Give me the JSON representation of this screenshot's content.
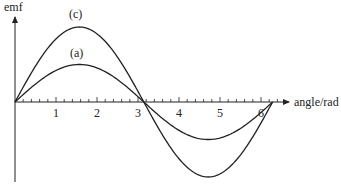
{
  "chart_data": {
    "type": "line",
    "title": "",
    "xlabel": "angle/rad",
    "ylabel": "emf",
    "xlim": [
      0,
      6.6
    ],
    "x_ticks": [
      1,
      2,
      3,
      4,
      5,
      6
    ],
    "x_tick_labels": [
      "1",
      "2",
      "3",
      "4",
      "5",
      "6"
    ],
    "minor_tick_step": 0.2,
    "grid": false,
    "legend": null,
    "series": [
      {
        "name": "(c)",
        "function": "2*sin(x)",
        "amplitude": 2,
        "x_range": [
          0,
          6.283
        ],
        "label_pos": {
          "x": 1.5,
          "y": 2.3
        }
      },
      {
        "name": "(a)",
        "function": "sin(x)",
        "amplitude": 1,
        "x_range": [
          0,
          6.283
        ],
        "label_pos": {
          "x": 1.55,
          "y": 1.35
        }
      }
    ],
    "annotations": [
      "(c)",
      "(a)"
    ]
  },
  "labels": {
    "y_axis": "emf",
    "x_axis": "angle/rad",
    "curve_c": "(c)",
    "curve_a": "(a)",
    "ticks": [
      "1",
      "2",
      "3",
      "4",
      "5",
      "6"
    ]
  },
  "colors": {
    "axis": "#222222",
    "curve": "#222222",
    "background": "#ffffff"
  }
}
